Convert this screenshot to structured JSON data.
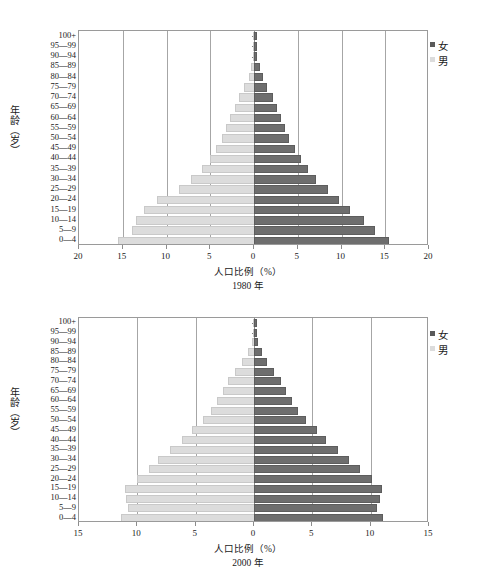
{
  "axis": {
    "y_title": "年龄（岁）",
    "x_title": "人口比例（%）",
    "age_groups": [
      "100+",
      "95—99",
      "90—94",
      "85—89",
      "80—84",
      "75—79",
      "70—74",
      "65—69",
      "60—64",
      "55—59",
      "50—54",
      "45—49",
      "40—44",
      "35—39",
      "30—34",
      "25—29",
      "20—24",
      "15—19",
      "10—14",
      "5—9",
      "0—4"
    ]
  },
  "legend": {
    "female_label": "女",
    "male_label": "男",
    "female_color": "#6e6e6e",
    "male_color": "#dcdcdc"
  },
  "chart_data": [
    {
      "type": "bar",
      "id": "pyramid-1980",
      "title": "1980 年",
      "year": "1980 年",
      "xlabel": "人口比例（%）",
      "ylabel": "年龄（岁）",
      "xlim": [
        -20,
        20
      ],
      "xticks": [
        20,
        15,
        10,
        5,
        0,
        5,
        10,
        15,
        20
      ],
      "xtick_values": [
        -20,
        -15,
        -10,
        -5,
        0,
        5,
        10,
        15,
        20
      ],
      "grid": true,
      "legend_position": "right",
      "categories": [
        "100+",
        "95—99",
        "90—94",
        "85—89",
        "80—84",
        "75—79",
        "70—74",
        "65—69",
        "60—64",
        "55—59",
        "50—54",
        "45—49",
        "40—44",
        "35—39",
        "30—34",
        "25—29",
        "20—24",
        "15—19",
        "10—14",
        "5—9",
        "0—4"
      ],
      "series": [
        {
          "name": "男",
          "side": "left",
          "values": [
            0.02,
            0.05,
            0.12,
            0.3,
            0.6,
            1.1,
            1.7,
            2.2,
            2.7,
            3.2,
            3.7,
            4.3,
            5.0,
            5.9,
            7.2,
            8.6,
            11.1,
            12.6,
            13.5,
            14.0,
            15.6
          ]
        },
        {
          "name": "女",
          "side": "right",
          "values": [
            0.02,
            0.05,
            0.15,
            0.4,
            0.8,
            1.3,
            1.9,
            2.4,
            2.8,
            3.3,
            3.8,
            4.4,
            5.1,
            5.9,
            6.9,
            8.2,
            9.5,
            10.7,
            12.3,
            13.6,
            15.2
          ]
        }
      ]
    },
    {
      "type": "bar",
      "id": "pyramid-2000",
      "title": "2000 年",
      "year": "2000 年",
      "xlabel": "人口比例（%）",
      "ylabel": "年龄（岁）",
      "xlim": [
        -15,
        15
      ],
      "xticks": [
        15,
        10,
        5,
        0,
        5,
        10,
        15
      ],
      "xtick_values": [
        -15,
        -10,
        -5,
        0,
        5,
        10,
        15
      ],
      "grid": true,
      "legend_position": "right",
      "categories": [
        "100+",
        "95—99",
        "90—94",
        "85—89",
        "80—84",
        "75—79",
        "70—74",
        "65—69",
        "60—64",
        "55—59",
        "50—54",
        "45—49",
        "40—44",
        "35—39",
        "30—34",
        "25—29",
        "20—24",
        "15—19",
        "10—14",
        "5—9",
        "0—4"
      ],
      "series": [
        {
          "name": "男",
          "side": "left",
          "values": [
            0.02,
            0.06,
            0.2,
            0.5,
            1.0,
            1.6,
            2.2,
            2.7,
            3.2,
            3.7,
            4.4,
            5.3,
            6.2,
            7.2,
            8.2,
            9.0,
            10.0,
            11.1,
            11.0,
            10.8,
            11.4
          ]
        },
        {
          "name": "女",
          "side": "right",
          "values": [
            0.02,
            0.06,
            0.2,
            0.5,
            0.9,
            1.5,
            2.1,
            2.6,
            3.1,
            3.6,
            4.3,
            5.2,
            6.0,
            7.0,
            8.0,
            8.9,
            9.9,
            10.8,
            10.6,
            10.4,
            10.9
          ]
        }
      ]
    }
  ]
}
